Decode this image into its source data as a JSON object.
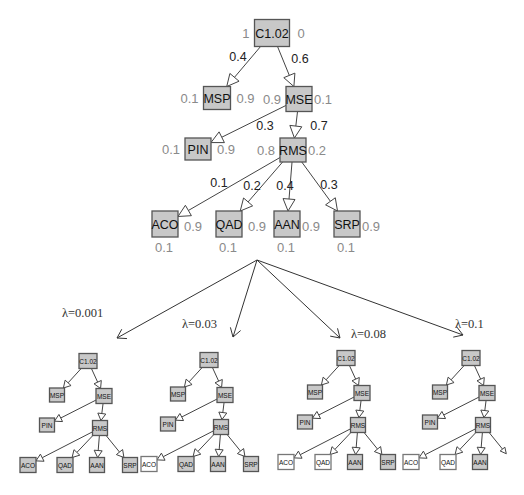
{
  "main_tree": {
    "nodes": [
      {
        "id": "C1.02",
        "label": "C1.02",
        "left_prob": "1",
        "right_prob": "0",
        "below_prob": ""
      },
      {
        "id": "MSP",
        "label": "MSP",
        "left_prob": "0.1",
        "right_prob": "0.9",
        "below_prob": ""
      },
      {
        "id": "MSE",
        "label": "MSE",
        "left_prob": "0.9",
        "right_prob": "0.1",
        "below_prob": ""
      },
      {
        "id": "PIN",
        "label": "PIN",
        "left_prob": "0.1",
        "right_prob": "0.9",
        "below_prob": ""
      },
      {
        "id": "RMS",
        "label": "RMS",
        "left_prob": "0.8",
        "right_prob": "0.2",
        "below_prob": ""
      },
      {
        "id": "ACO",
        "label": "ACO",
        "left_prob": "",
        "right_prob": "0.9",
        "below_prob": "0.1"
      },
      {
        "id": "QAD",
        "label": "QAD",
        "left_prob": "",
        "right_prob": "0.9",
        "below_prob": "0.1"
      },
      {
        "id": "AAN",
        "label": "AAN",
        "left_prob": "",
        "right_prob": "0.9",
        "below_prob": "0.1"
      },
      {
        "id": "SRP",
        "label": "SRP",
        "left_prob": "",
        "right_prob": "0.9",
        "below_prob": "0.1"
      }
    ],
    "edges": [
      {
        "from": "C1.02",
        "to": "MSP",
        "weight": "0.4"
      },
      {
        "from": "C1.02",
        "to": "MSE",
        "weight": "0.6"
      },
      {
        "from": "MSE",
        "to": "PIN",
        "weight": "0.3"
      },
      {
        "from": "MSE",
        "to": "RMS",
        "weight": "0.7"
      },
      {
        "from": "RMS",
        "to": "ACO",
        "weight": "0.1"
      },
      {
        "from": "RMS",
        "to": "QAD",
        "weight": "0.2"
      },
      {
        "from": "RMS",
        "to": "AAN",
        "weight": "0.4"
      },
      {
        "from": "RMS",
        "to": "SRP",
        "weight": "0.3"
      }
    ]
  },
  "pruned_trees": [
    {
      "lambda_label": "λ=0.001",
      "white_nodes": [],
      "removed_nodes": []
    },
    {
      "lambda_label": "λ=0.03",
      "white_nodes": [
        "ACO"
      ],
      "removed_nodes": []
    },
    {
      "lambda_label": "λ=0.08",
      "white_nodes": [
        "ACO",
        "QAD"
      ],
      "removed_nodes": []
    },
    {
      "lambda_label": "λ=0.1",
      "white_nodes": [
        "ACO",
        "QAD"
      ],
      "removed_nodes": [
        "SRP"
      ]
    }
  ]
}
